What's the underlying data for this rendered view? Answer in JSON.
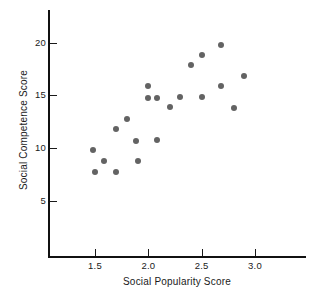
{
  "chart_data": {
    "type": "scatter",
    "title": "",
    "xlabel": "Social Popularity Score",
    "ylabel": "Social Competence Score",
    "xlim": [
      1.2,
      3.2
    ],
    "ylim": [
      2.5,
      21.5
    ],
    "xticks": [
      "1.5",
      "2.0",
      "2.5",
      "3.0"
    ],
    "xtick_values": [
      1.5,
      2.0,
      2.5,
      3.0
    ],
    "yticks": [
      "5",
      "10",
      "15",
      "20"
    ],
    "ytick_values": [
      5,
      10,
      15,
      20
    ],
    "grid": false,
    "legend": "none",
    "marker_color": "#636363",
    "axis_color": "#111111",
    "points": [
      {
        "x": 1.48,
        "y": 9.85
      },
      {
        "x": 1.5,
        "y": 7.75
      },
      {
        "x": 1.58,
        "y": 8.75
      },
      {
        "x": 1.7,
        "y": 11.8
      },
      {
        "x": 1.7,
        "y": 7.75
      },
      {
        "x": 1.8,
        "y": 12.8
      },
      {
        "x": 1.88,
        "y": 10.7
      },
      {
        "x": 1.9,
        "y": 8.8
      },
      {
        "x": 2.0,
        "y": 15.85
      },
      {
        "x": 2.0,
        "y": 14.75
      },
      {
        "x": 2.08,
        "y": 14.75
      },
      {
        "x": 2.08,
        "y": 10.75
      },
      {
        "x": 2.2,
        "y": 13.85
      },
      {
        "x": 2.3,
        "y": 14.85
      },
      {
        "x": 2.4,
        "y": 17.85
      },
      {
        "x": 2.5,
        "y": 18.8
      },
      {
        "x": 2.5,
        "y": 14.85
      },
      {
        "x": 2.68,
        "y": 19.75
      },
      {
        "x": 2.68,
        "y": 15.9
      },
      {
        "x": 2.8,
        "y": 13.8
      },
      {
        "x": 2.9,
        "y": 16.8
      }
    ]
  }
}
